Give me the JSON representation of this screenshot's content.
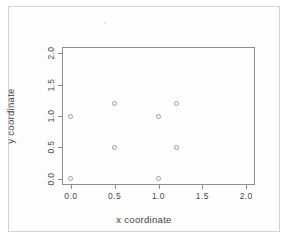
{
  "figure": {
    "background_color": "#ffffff",
    "frame_color": "#d2d2d2",
    "axis_color": "#8d8d8d",
    "marker_color": "#9a9a9a",
    "artifact_name": "scan-speck"
  },
  "chart_data": {
    "type": "scatter",
    "title": "",
    "xlabel": "x coordinate",
    "ylabel": "y coordinate",
    "xlim": [
      -0.1,
      2.1
    ],
    "ylim": [
      -0.1,
      2.1
    ],
    "xticks": [
      0.0,
      0.5,
      1.0,
      1.5,
      2.0
    ],
    "yticks": [
      0.0,
      0.5,
      1.0,
      1.5,
      2.0
    ],
    "xtick_labels": [
      "0.0",
      "0.5",
      "1.0",
      "1.5",
      "2.0"
    ],
    "ytick_labels": [
      "0.0",
      "0.5",
      "1.0",
      "1.5",
      "2.0"
    ],
    "grid": false,
    "legend": null,
    "marker": "open-circle",
    "series": [
      {
        "name": "points",
        "x": [
          0.0,
          0.0,
          0.5,
          0.5,
          1.0,
          1.0,
          1.2,
          1.2
        ],
        "y": [
          1.0,
          0.0,
          1.2,
          0.5,
          1.0,
          0.0,
          1.2,
          0.5
        ]
      }
    ],
    "points": [
      {
        "x": 0.0,
        "y": 1.0
      },
      {
        "x": 0.0,
        "y": 0.0
      },
      {
        "x": 0.5,
        "y": 1.2
      },
      {
        "x": 0.5,
        "y": 0.5
      },
      {
        "x": 1.0,
        "y": 1.0
      },
      {
        "x": 1.0,
        "y": 0.0
      },
      {
        "x": 1.2,
        "y": 1.2
      },
      {
        "x": 1.2,
        "y": 0.5
      }
    ]
  }
}
